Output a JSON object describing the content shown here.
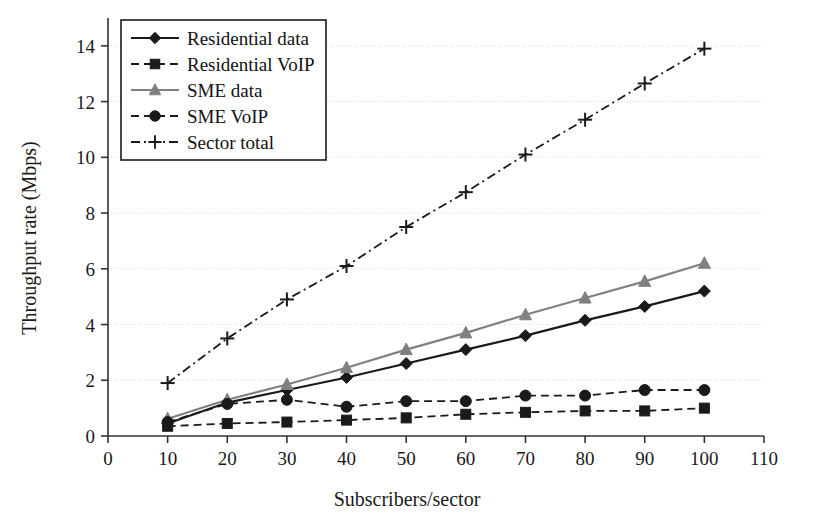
{
  "chart_data": {
    "type": "line",
    "title": "",
    "xlabel": "Subscribers/sector",
    "ylabel": "Throughput rate (Mbps)",
    "xlim": [
      0,
      110
    ],
    "ylim": [
      0,
      15
    ],
    "xticks": [
      0,
      10,
      20,
      30,
      40,
      50,
      60,
      70,
      80,
      90,
      100,
      110
    ],
    "yticks": [
      0,
      2,
      4,
      6,
      8,
      10,
      12,
      14
    ],
    "grid": "horizontal",
    "legend_position": "top-left",
    "x": [
      10,
      20,
      30,
      40,
      50,
      60,
      70,
      80,
      90,
      100
    ],
    "series": [
      {
        "name": "Residential data",
        "marker": "diamond",
        "linestyle": "solid",
        "color": "#1a1a1a",
        "values": [
          0.45,
          1.2,
          1.65,
          2.1,
          2.6,
          3.1,
          3.6,
          4.15,
          4.65,
          5.2
        ]
      },
      {
        "name": "Residential VoIP",
        "marker": "square",
        "linestyle": "dashed",
        "color": "#1a1a1a",
        "values": [
          0.35,
          0.45,
          0.5,
          0.57,
          0.65,
          0.78,
          0.85,
          0.9,
          0.9,
          1.0
        ]
      },
      {
        "name": "SME data",
        "marker": "triangle",
        "linestyle": "solid",
        "color": "#808080",
        "values": [
          0.62,
          1.3,
          1.85,
          2.45,
          3.1,
          3.7,
          4.35,
          4.95,
          5.55,
          6.2
        ]
      },
      {
        "name": "SME VoIP",
        "marker": "circle",
        "linestyle": "dashed",
        "color": "#1a1a1a",
        "values": [
          0.5,
          1.15,
          1.3,
          1.05,
          1.25,
          1.25,
          1.45,
          1.45,
          1.65,
          1.65
        ]
      },
      {
        "name": "Sector total",
        "marker": "plus",
        "linestyle": "dashdot",
        "color": "#1a1a1a",
        "values": [
          1.9,
          3.5,
          4.9,
          6.1,
          7.5,
          8.75,
          10.1,
          11.35,
          12.65,
          13.9
        ]
      }
    ]
  },
  "axes": {
    "y_title": "Throughput rate (Mbps)",
    "x_title": "Subscribers/sector",
    "y_tick_labels": [
      "0",
      "2",
      "4",
      "6",
      "8",
      "10",
      "12",
      "14"
    ],
    "x_tick_labels": [
      "0",
      "10",
      "20",
      "30",
      "40",
      "50",
      "60",
      "70",
      "80",
      "90",
      "100",
      "110"
    ]
  },
  "legend": {
    "items": [
      {
        "label": "Residential data"
      },
      {
        "label": "Residential VoIP"
      },
      {
        "label": "SME data"
      },
      {
        "label": "SME VoIP"
      },
      {
        "label": "Sector total"
      }
    ]
  },
  "colors": {
    "axis": "#333333",
    "grid": "#d8d8d8",
    "dark": "#1a1a1a",
    "grey": "#808080",
    "background": "#ffffff"
  }
}
